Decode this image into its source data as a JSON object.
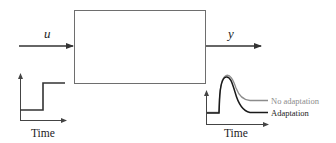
{
  "diagram": {
    "type": "block-diagram",
    "block": {
      "label": ""
    },
    "input": {
      "label": "u"
    },
    "output": {
      "label": "y"
    },
    "input_plot": {
      "xlabel": "Time",
      "signal": "step"
    },
    "output_plot": {
      "xlabel": "Time",
      "legend": [
        {
          "label": "No adaptation",
          "color": "#8c8c8c"
        },
        {
          "label": "Adaptation",
          "color": "#1a1a1a"
        }
      ]
    }
  },
  "colors": {
    "line": "#3a3a3a",
    "box": "#6e6e6e",
    "gray_curve": "#8c8c8c",
    "black_curve": "#1a1a1a"
  }
}
